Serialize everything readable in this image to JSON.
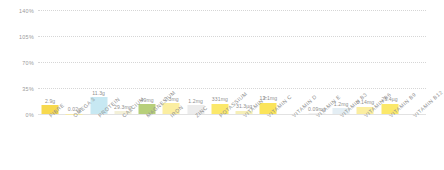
{
  "chart_data": {
    "type": "bar",
    "title": "",
    "xlabel": "",
    "ylabel": "PERCENTAGE OF RDA",
    "ylim": [
      0,
      140
    ],
    "ytick_labels": [
      "140%",
      "105%",
      "70%",
      "35%",
      "0%"
    ],
    "ytick_values": [
      140,
      105,
      70,
      35,
      0
    ],
    "grid": true,
    "legend": "none",
    "categories": [
      "FIBRE",
      "OMEGA 3",
      "PROTEIN",
      "CALCIUM",
      "MAGNESIUM",
      "IRON",
      "ZINC",
      "POTASSIUM",
      "VITAMIN A",
      "VITAMIN C",
      "VITAMIN D",
      "VITAMIN E",
      "VITAMIN B3",
      "VITAMIN B6",
      "VITAMIN B9",
      "VITAMIN B12"
    ],
    "data_labels": [
      "2.9g",
      "0.02g",
      "11.3g",
      "29.3mg",
      "49mg",
      "2.3mg",
      "1.2mg",
      "331mg",
      "31.3µg",
      "12.1mg",
      "",
      "0.09mg",
      "1.2mg",
      "0.14mg",
      "26.4µg"
    ],
    "bars": [
      {
        "category": "FIBRE",
        "label": "2.9g",
        "value": 11.6,
        "color": "#f7d94e"
      },
      {
        "category": "OMEGA 3",
        "label": "0.02g",
        "value": 0.6,
        "color": "#f5e9a8"
      },
      {
        "category": "PROTEIN",
        "label": "11.3g",
        "value": 22.5,
        "color": "#c7e8f2"
      },
      {
        "category": "CALCIUM",
        "label": "29.3mg",
        "value": 3.6,
        "color": "#f3f0d8"
      },
      {
        "category": "MAGNESIUM",
        "label": "49mg",
        "value": 13.0,
        "color": "#b7cf7a"
      },
      {
        "category": "IRON",
        "label": "2.3mg",
        "value": 14.5,
        "color": "#fbeea1"
      },
      {
        "category": "ZINC",
        "label": "1.2mg",
        "value": 11.5,
        "color": "#ececec"
      },
      {
        "category": "POTASSIUM",
        "label": "331mg",
        "value": 14.0,
        "color": "#fbe86a"
      },
      {
        "category": "VITAMIN A",
        "label": "31.3µg",
        "value": 4.5,
        "color": "#f6efb8"
      },
      {
        "category": "VITAMIN C",
        "label": "12.1mg",
        "value": 15.0,
        "color": "#fbe45a"
      },
      {
        "category": "VITAMIN D",
        "label": "",
        "value": 0.0,
        "color": "#f0f0f0"
      },
      {
        "category": "VITAMIN E",
        "label": "0.09mg",
        "value": 0.8,
        "color": "#f2f2f2"
      },
      {
        "category": "VITAMIN B3",
        "label": "1.2mg",
        "value": 7.5,
        "color": "#e4eef4"
      },
      {
        "category": "VITAMIN B6",
        "label": "0.14mg",
        "value": 9.5,
        "color": "#fbeea1"
      },
      {
        "category": "VITAMIN B9",
        "label": "26.4µg",
        "value": 13.5,
        "color": "#fbe86a"
      },
      {
        "category": "VITAMIN B12",
        "label": "",
        "value": 0.0,
        "color": "#f0f0f0"
      }
    ]
  },
  "colors": {
    "grid": "#d6d6d6",
    "axis_text": "#9a9a9a",
    "label_text": "#8f8f8f",
    "background": "#ffffff"
  }
}
